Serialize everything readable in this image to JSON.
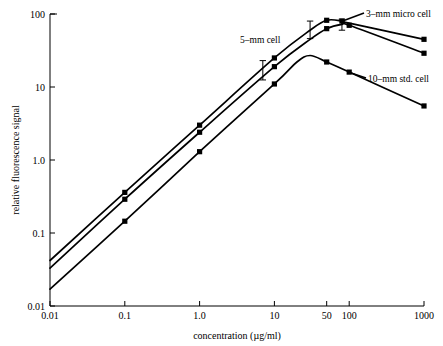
{
  "chart_data": {
    "type": "line",
    "title": "",
    "xlabel": "concentration (µg/ml)",
    "ylabel": "relative fluorescence signal",
    "xscale": "log",
    "yscale": "log",
    "xlim": [
      0.01,
      1000
    ],
    "ylim": [
      0.01,
      100
    ],
    "grid": false,
    "legend_position": "inline-annotations",
    "xticks": [
      {
        "value": 0.01,
        "label": "0.01"
      },
      {
        "value": 0.1,
        "label": "0.1"
      },
      {
        "value": 1.0,
        "label": "1.0"
      },
      {
        "value": 10,
        "label": "10"
      },
      {
        "value": 50,
        "label": "50"
      },
      {
        "value": 100,
        "label": "100"
      },
      {
        "value": 1000,
        "label": "1000"
      }
    ],
    "yticks": [
      {
        "value": 0.01,
        "label": "0.01"
      },
      {
        "value": 0.1,
        "label": "0.1"
      },
      {
        "value": 1.0,
        "label": "1.0"
      },
      {
        "value": 10,
        "label": "10"
      },
      {
        "value": 100,
        "label": "100"
      }
    ],
    "series": [
      {
        "name": "3-mm micro cell",
        "label": "3–mm micro cell",
        "x": [
          0.01,
          0.1,
          1.0,
          10,
          30,
          50,
          80,
          100,
          1000
        ],
        "values": [
          0.042,
          0.36,
          3.0,
          25,
          60,
          82,
          80,
          75,
          45
        ],
        "markers_x": [
          0.1,
          1.0,
          10,
          50,
          80,
          1000
        ],
        "markers_y": [
          0.36,
          3.0,
          25,
          82,
          80,
          45
        ]
      },
      {
        "name": "5-mm cell",
        "label": "5–mm cell",
        "x": [
          0.01,
          0.1,
          1.0,
          10,
          30,
          50,
          80,
          100,
          1000
        ],
        "values": [
          0.033,
          0.29,
          2.4,
          19,
          45,
          63,
          72,
          70,
          29
        ],
        "markers_x": [
          0.1,
          1.0,
          10,
          50,
          100,
          1000
        ],
        "markers_y": [
          0.29,
          2.4,
          19,
          63,
          70,
          29
        ]
      },
      {
        "name": "10-mm std. cell",
        "label": "10–mm std. cell",
        "x": [
          0.01,
          0.1,
          1.0,
          10,
          20,
          30,
          50,
          100,
          1000
        ],
        "values": [
          0.017,
          0.145,
          1.3,
          11,
          22,
          27,
          22,
          16,
          5.5
        ],
        "markers_x": [
          0.1,
          1.0,
          10,
          50,
          100,
          1000
        ],
        "markers_y": [
          0.145,
          1.3,
          11,
          22,
          16,
          5.5
        ]
      }
    ],
    "error_bars": [
      {
        "series": "3-mm micro cell",
        "x": 7.0,
        "low": 12.5,
        "high": 23
      },
      {
        "series": "3-mm micro cell",
        "x": 30,
        "low": 46,
        "high": 80
      },
      {
        "series": "5-mm cell",
        "x": 80,
        "low": 60,
        "high": 85
      }
    ],
    "annotations": [
      {
        "text": "3–mm micro cell",
        "x_px": 370,
        "y_px": 14
      },
      {
        "text": "5–mm cell",
        "x_px": 236,
        "y_px": 40
      },
      {
        "text": "10–mm std. cell",
        "x_px": 374,
        "y_px": 79
      }
    ]
  }
}
